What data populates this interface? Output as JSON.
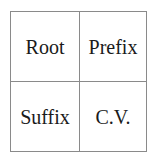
{
  "grid": {
    "cells": [
      {
        "label": "Root"
      },
      {
        "label": "Prefix"
      },
      {
        "label": "Suffix"
      },
      {
        "label": "C.V."
      }
    ]
  },
  "colors": {
    "border": "#8a8a8a",
    "text": "#1a1a1a",
    "background": "#ffffff"
  }
}
